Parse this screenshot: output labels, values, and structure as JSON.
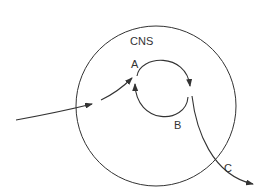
{
  "diagram": {
    "region_label": "CNS",
    "nodes": [
      {
        "id": "A",
        "label": "A"
      },
      {
        "id": "B",
        "label": "B"
      },
      {
        "id": "C",
        "label": "C"
      }
    ],
    "colors": {
      "stroke": "#333333",
      "background": "#ffffff"
    }
  }
}
